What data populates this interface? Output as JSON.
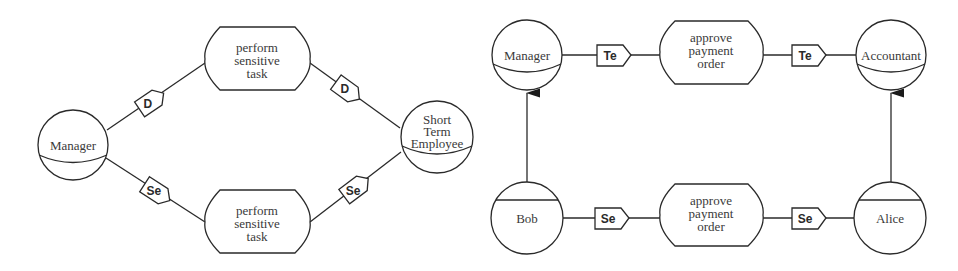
{
  "left_diagram": {
    "roles": {
      "manager": "Manager",
      "short_term_employee": [
        "Short",
        "Term",
        "Employee"
      ]
    },
    "tasks": {
      "top": [
        "perform",
        "sensitive",
        "task"
      ],
      "bottom": [
        "perform",
        "sensitive",
        "task"
      ]
    },
    "tags": {
      "top_left": "D",
      "top_right": "D",
      "bottom_left": "Se",
      "bottom_right": "Se"
    }
  },
  "right_diagram": {
    "roles": {
      "manager": "Manager",
      "accountant": "Accountant"
    },
    "users": {
      "bob": "Bob",
      "alice": "Alice"
    },
    "tasks": {
      "top": [
        "approve",
        "payment",
        "order"
      ],
      "bottom": [
        "approve",
        "payment",
        "order"
      ]
    },
    "tags": {
      "top_left": "Te",
      "top_right": "Te",
      "bottom_left": "Se",
      "bottom_right": "Se"
    }
  }
}
